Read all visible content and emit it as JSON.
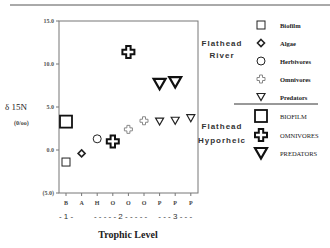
{
  "chart_data": {
    "type": "scatter",
    "title": "",
    "xlabel": "Trophic Level",
    "ylabel": "δ 15N",
    "ylabel_units": "(0/oo)",
    "ylim": [
      -5.0,
      15.0
    ],
    "y_ticks": [
      {
        "value": 15.0,
        "label": "15.0"
      },
      {
        "value": 10.0,
        "label": "10.0"
      },
      {
        "value": 5.0,
        "label": "5.0"
      },
      {
        "value": 0.0,
        "label": "0.0"
      },
      {
        "value": -5.0,
        "label": "(5.0)"
      }
    ],
    "categories": [
      "B",
      "A",
      "H",
      "O",
      "O",
      "O",
      "P",
      "P",
      "P"
    ],
    "trophic_groups": [
      {
        "label": "- 1 -",
        "from": 0,
        "to": 0
      },
      {
        "label": "- - - - - 2 - - - - -",
        "from": 2,
        "to": 5
      },
      {
        "label": "- - - 3 - - -",
        "from": 6,
        "to": 8
      }
    ],
    "grid": false,
    "legend_position": "right",
    "legend_groups": [
      {
        "name": "Flathead River",
        "line1": "Flathead",
        "line2": "River"
      },
      {
        "name": "Flathead Hyporheic",
        "line1": "Flathead",
        "line2": "Hyporheic"
      }
    ],
    "series": [
      {
        "name": "Biofilm",
        "group": "Flathead River",
        "marker": "square-small",
        "points": [
          {
            "x": 0,
            "y": -1.4
          }
        ]
      },
      {
        "name": "Algae",
        "group": "Flathead River",
        "marker": "diamond-small",
        "points": [
          {
            "x": 1,
            "y": -0.4
          }
        ]
      },
      {
        "name": "Herbivores",
        "group": "Flathead River",
        "marker": "circle-small",
        "points": [
          {
            "x": 2,
            "y": 1.3
          }
        ]
      },
      {
        "name": "Omnivores",
        "group": "Flathead River",
        "marker": "cross-small",
        "points": [
          {
            "x": 4,
            "y": 2.4
          },
          {
            "x": 5,
            "y": 3.4
          }
        ]
      },
      {
        "name": "Predators",
        "group": "Flathead River",
        "marker": "triangle-small",
        "points": [
          {
            "x": 6,
            "y": 3.3
          },
          {
            "x": 7,
            "y": 3.4
          },
          {
            "x": 8,
            "y": 3.7
          }
        ]
      },
      {
        "name": "BIOFILM",
        "group": "Flathead Hyporheic",
        "marker": "square-large",
        "points": [
          {
            "x": 0,
            "y": 3.3
          }
        ]
      },
      {
        "name": "OMNIVORES",
        "group": "Flathead Hyporheic",
        "marker": "cross-large",
        "points": [
          {
            "x": 3,
            "y": 1.0
          },
          {
            "x": 4,
            "y": 11.4
          }
        ]
      },
      {
        "name": "PREDATORS",
        "group": "Flathead Hyporheic",
        "marker": "triangle-large",
        "points": [
          {
            "x": 6,
            "y": 7.7
          },
          {
            "x": 7,
            "y": 7.9
          }
        ]
      }
    ]
  }
}
